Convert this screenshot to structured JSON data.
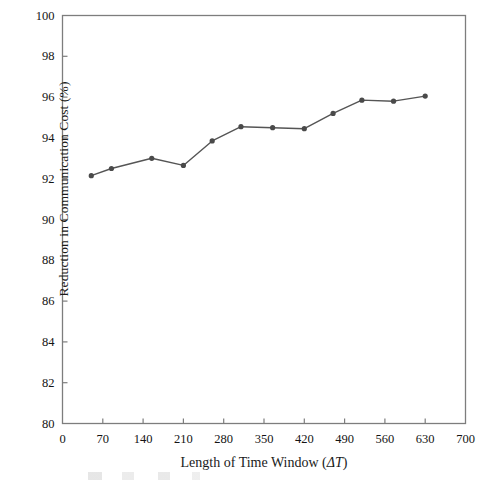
{
  "chart_data": {
    "type": "line",
    "title": "",
    "xlabel": "Length of Time Window (ΔT)",
    "ylabel": "Reduction in Communication Cost (%)",
    "xlim": [
      0,
      700
    ],
    "ylim": [
      80,
      100
    ],
    "xticks": [
      0,
      70,
      140,
      210,
      280,
      350,
      420,
      490,
      560,
      630,
      700
    ],
    "yticks": [
      80,
      82,
      84,
      86,
      88,
      90,
      92,
      94,
      96,
      98,
      100
    ],
    "grid": false,
    "legend": null,
    "series": [
      {
        "name": "Reduction in Communication Cost",
        "color": "#555555",
        "marker": "circle",
        "x": [
          50,
          85,
          155,
          210,
          260,
          310,
          365,
          420,
          470,
          520,
          575,
          630
        ],
        "values": [
          92.15,
          92.5,
          93.0,
          92.65,
          93.85,
          94.55,
          94.5,
          94.45,
          95.2,
          95.85,
          95.8,
          96.05
        ]
      }
    ]
  },
  "axis": {
    "x_title_prefix": "Length of Time Window (",
    "x_title_delta": "ΔT",
    "x_title_suffix": ")",
    "y_title": "Reduction in Communication Cost (%)"
  },
  "style": {
    "line_color": "#555555",
    "marker_color": "#4a4a4a",
    "frame_color": "#7d7d7d",
    "text_color": "#141414",
    "background": "#ffffff"
  }
}
